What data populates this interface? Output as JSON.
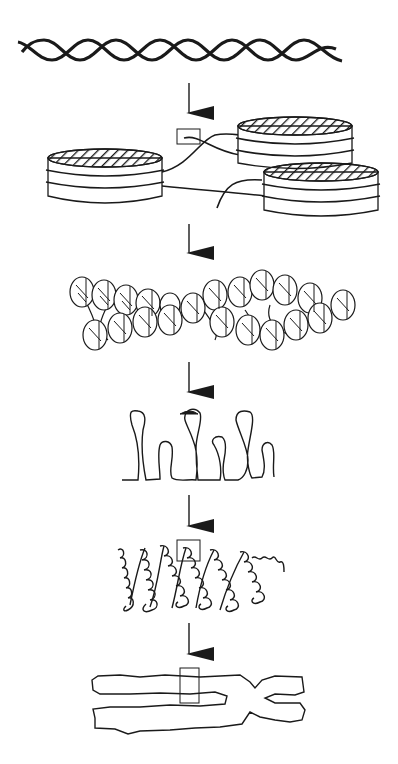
{
  "diagram": {
    "type": "dna-packaging-levels",
    "background": "#ffffff",
    "ink_color": "#1a1a1a",
    "stages": [
      {
        "id": "double-helix",
        "name": "DNA double helix"
      },
      {
        "id": "nucleosomes",
        "name": "Nucleosomes (beads on a string)"
      },
      {
        "id": "chromatin-fiber",
        "name": "30 nm chromatin fiber"
      },
      {
        "id": "looped-domains",
        "name": "Looped domains"
      },
      {
        "id": "coiled-loops",
        "name": "Condensed coiled loops"
      },
      {
        "id": "chromosome",
        "name": "Metaphase chromosome"
      }
    ],
    "arrows": 5
  }
}
